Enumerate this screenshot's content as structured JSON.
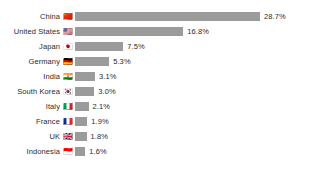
{
  "chart_data": {
    "type": "bar",
    "orientation": "horizontal",
    "title": "",
    "subtitle": "",
    "xlabel": "",
    "ylabel": "",
    "grid": false,
    "legend": null,
    "axis_visible": false,
    "value_suffix": "%",
    "xlim": [
      0,
      28.7
    ],
    "bar_color": "#9b9b9b",
    "text_color": "#2b2b2b",
    "background_color": "#ffffff",
    "categories": [
      "China",
      "United States",
      "Japan",
      "Germany",
      "India",
      "South Korea",
      "Italy",
      "France",
      "UK",
      "Indonesia"
    ],
    "values": [
      28.7,
      16.8,
      7.5,
      5.3,
      3.1,
      3.0,
      2.1,
      1.9,
      1.8,
      1.6
    ],
    "value_labels": [
      "28.7%",
      "16.8%",
      "7.5%",
      "5.3%",
      "3.1%",
      "3.0%",
      "2.1%",
      "1.9%",
      "1.8%",
      "1.6%"
    ],
    "markers": [
      "🇨🇳",
      "🇺🇸",
      "🇯🇵",
      "🇩🇪",
      "🇮🇳",
      "🇰🇷",
      "🇮🇹",
      "🇫🇷",
      "🇬🇧",
      "🇮🇩"
    ],
    "marker_names": [
      "flag-china-icon",
      "flag-united-states-icon",
      "flag-japan-icon",
      "flag-germany-icon",
      "flag-india-icon",
      "flag-south-korea-icon",
      "flag-italy-icon",
      "flag-france-icon",
      "flag-uk-icon",
      "flag-indonesia-icon"
    ],
    "rows": [
      {
        "label": "China",
        "value": 28.7,
        "value_label": "28.7%",
        "marker": "🇨🇳",
        "marker_name": "flag-china-icon"
      },
      {
        "label": "United States",
        "value": 16.8,
        "value_label": "16.8%",
        "marker": "🇺🇸",
        "marker_name": "flag-united-states-icon"
      },
      {
        "label": "Japan",
        "value": 7.5,
        "value_label": "7.5%",
        "marker": "🇯🇵",
        "marker_name": "flag-japan-icon"
      },
      {
        "label": "Germany",
        "value": 5.3,
        "value_label": "5.3%",
        "marker": "🇩🇪",
        "marker_name": "flag-germany-icon"
      },
      {
        "label": "India",
        "value": 3.1,
        "value_label": "3.1%",
        "marker": "🇮🇳",
        "marker_name": "flag-india-icon"
      },
      {
        "label": "South Korea",
        "value": 3.0,
        "value_label": "3.0%",
        "marker": "🇰🇷",
        "marker_name": "flag-south-korea-icon"
      },
      {
        "label": "Italy",
        "value": 2.1,
        "value_label": "2.1%",
        "marker": "🇮🇹",
        "marker_name": "flag-italy-icon"
      },
      {
        "label": "France",
        "value": 1.9,
        "value_label": "1.9%",
        "marker": "🇫🇷",
        "marker_name": "flag-france-icon"
      },
      {
        "label": "UK",
        "value": 1.8,
        "value_label": "1.8%",
        "marker": "🇬🇧",
        "marker_name": "flag-uk-icon"
      },
      {
        "label": "Indonesia",
        "value": 1.6,
        "value_label": "1.6%",
        "marker": "🇮🇩",
        "marker_name": "flag-indonesia-icon"
      }
    ]
  }
}
